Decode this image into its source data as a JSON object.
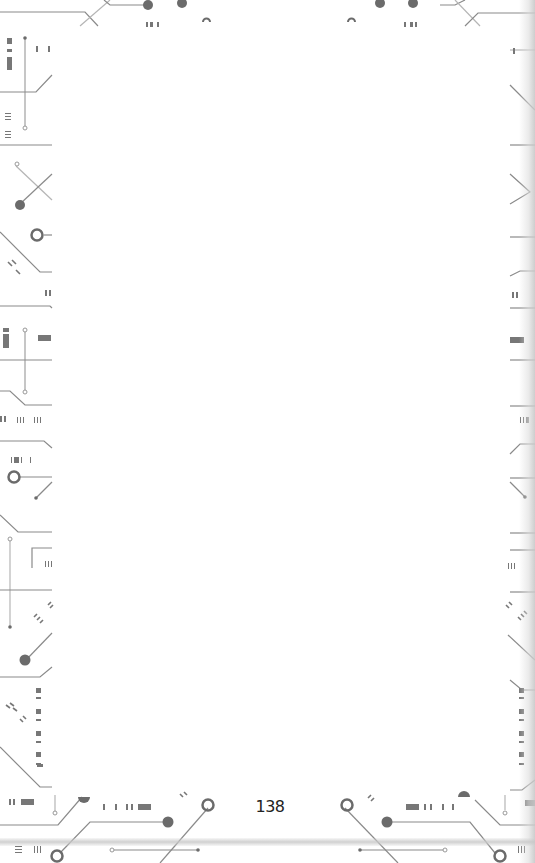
{
  "page": {
    "page_number": "138",
    "content": "",
    "border_style": "circuit-board",
    "colors": {
      "line": "#8a8a8a",
      "light_line": "#b5b5b5",
      "node_fill": "#6b6b6b",
      "text": "#222222",
      "background": "#ffffff"
    }
  }
}
